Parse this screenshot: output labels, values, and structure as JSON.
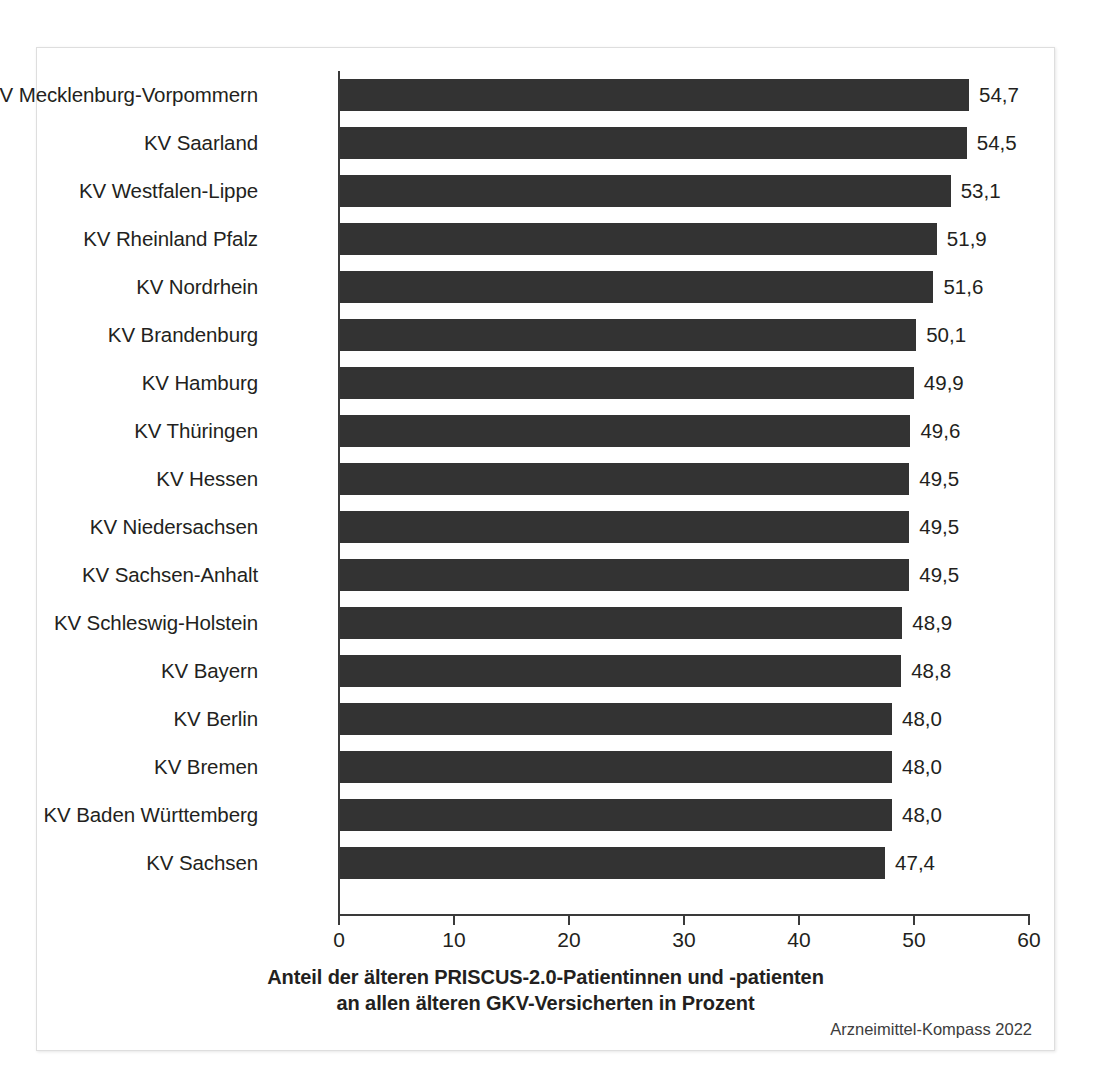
{
  "chart_data": {
    "type": "bar",
    "orientation": "horizontal",
    "title": "",
    "xlabel": "Anteil der älteren PRISCUS-2.0-Patientinnen und -patienten an allen älteren GKV-Versicherten in Prozent",
    "xlabel_lines": [
      "Anteil der älteren PRISCUS-2.0-Patientinnen und -patienten",
      "an allen älteren GKV-Versicherten in Prozent"
    ],
    "ylabel": "",
    "xlim": [
      0,
      60
    ],
    "xticks": [
      0,
      10,
      20,
      30,
      40,
      50,
      60
    ],
    "xtick_labels": [
      "0",
      "10",
      "20",
      "30",
      "40",
      "50",
      "60"
    ],
    "grid": false,
    "legend": false,
    "bar_color": "#333333",
    "axis_color": "#3a3a3a",
    "decimal_separator": ",",
    "categories": [
      "KV Mecklenburg-Vorpommern",
      "KV Saarland",
      "KV Westfalen-Lippe",
      "KV Rheinland Pfalz",
      "KV Nordrhein",
      "KV Brandenburg",
      "KV Hamburg",
      "KV Thüringen",
      "KV Hessen",
      "KV Niedersachsen",
      "KV Sachsen-Anhalt",
      "KV Schleswig-Holstein",
      "KV Bayern",
      "KV Berlin",
      "KV Bremen",
      "KV Baden Württemberg",
      "KV Sachsen"
    ],
    "values": [
      54.7,
      54.5,
      53.1,
      51.9,
      51.6,
      50.1,
      49.9,
      49.6,
      49.5,
      49.5,
      49.5,
      48.9,
      48.8,
      48.0,
      48.0,
      48.0,
      47.4
    ],
    "value_labels": [
      "54,7",
      "54,5",
      "53,1",
      "51,9",
      "51,6",
      "50,1",
      "49,9",
      "49,6",
      "49,5",
      "49,5",
      "49,5",
      "48,9",
      "48,8",
      "48,0",
      "48,0",
      "48,0",
      "47,4"
    ]
  },
  "source_note": "Arzneimittel-Kompass 2022"
}
